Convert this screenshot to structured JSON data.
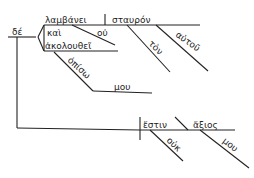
{
  "diagram": {
    "type": "sentence-diagram",
    "language": "Greek",
    "line_color": "#222222",
    "background": "#ffffff",
    "words": {
      "conjunction_de": "δέ",
      "verb_lambanei": "λαμβάνει",
      "object_stauron": "σταυρόν",
      "article_ton": "τὸν",
      "modifier_autou": "αὐτοῦ",
      "negation_ou_1": "οὐ",
      "conjunction_kai": "καὶ",
      "verb_akolouthei": "ἀκολουθεῖ",
      "preposition_opiso": "ὀπίσω",
      "object_mou_1": "μου",
      "verb_estin": "ἔστιν",
      "predicate_axios": "ἄξιος",
      "negation_ouk": "οὐκ",
      "modifier_mou_2": "μου"
    }
  }
}
